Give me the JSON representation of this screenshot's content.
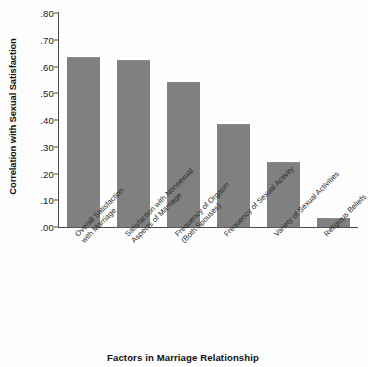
{
  "chart_data": {
    "type": "bar",
    "title": "",
    "xlabel": "Factors in Marriage Relationship",
    "ylabel": "Correlation with Sexual Satisfaction",
    "ylim": [
      0.0,
      0.8
    ],
    "ytick_labels": [
      ".80",
      ".70",
      ".60",
      ".50",
      ".40",
      ".30",
      ".20",
      ".10",
      ".00"
    ],
    "ytick_values": [
      0.8,
      0.7,
      0.6,
      0.5,
      0.4,
      0.3,
      0.2,
      0.1,
      0.0
    ],
    "grid": false,
    "legend": "none",
    "bar_color": "#808080",
    "axis_color": "#4a4a4a",
    "categories": [
      "Overall Satisfaction\nwith Marriage",
      "Satisfaction with Nonsexual\nAspects of Marriage",
      "Frequency of Orgasm\n(Both Spouses)",
      "Frequency of Sexual Activity",
      "Variety of Sexual Activities",
      "Religious Beliefs"
    ],
    "category_lines": [
      [
        "Overall Satisfaction",
        "with Marriage"
      ],
      [
        "Satisfaction with Nonsexual",
        "Aspects of Marriage"
      ],
      [
        "Frequency of Orgasm",
        "(Both Spouses)"
      ],
      [
        "Frequency of Sexual Activity"
      ],
      [
        "Variety of Sexual Activities"
      ],
      [
        "Religious Beliefs"
      ]
    ],
    "values": [
      0.63,
      0.62,
      0.54,
      0.38,
      0.24,
      0.03
    ]
  }
}
